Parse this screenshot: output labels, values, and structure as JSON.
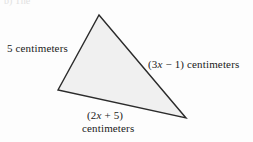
{
  "figure": {
    "type": "geometry-diagram",
    "shape": "triangle",
    "partial_header_text": "b) The",
    "background_color": "#fdfdfd",
    "fill_color": "#f0f0f0",
    "stroke_color": "#2b2b2b",
    "text_color": "#1a1a1a",
    "vertices": {
      "apex": {
        "x": 99,
        "y": 15
      },
      "left": {
        "x": 58,
        "y": 90
      },
      "right": {
        "x": 186,
        "y": 118
      }
    },
    "labels": {
      "left_side": {
        "prefix": "5 centimeters",
        "variable": "",
        "suffix": ""
      },
      "right_side": {
        "prefix": "(3",
        "variable": "x",
        "suffix": " − 1) centimeters"
      },
      "bottom_side": {
        "line1_prefix": "(2",
        "line1_variable": "x",
        "line1_suffix": " + 5)",
        "line2": "centimeters"
      }
    }
  }
}
